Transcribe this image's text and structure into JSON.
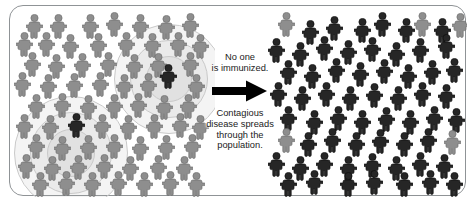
{
  "diagram": {
    "type": "two-panel-infographic",
    "colors": {
      "background": "#ffffff",
      "frame_border": "#8f9396",
      "healthy_person": "#8e8e8e",
      "healthy_person_outline": "#6f6f6f",
      "infected_person": "#262626",
      "infected_person_outline": "#0f0f0f",
      "halo_ring": "#c9c9c9",
      "arrow": "#000000",
      "caption_text": "#1b1b1b"
    },
    "center": {
      "caption_top": "No one\nis immunized.",
      "arrow_icon": "right-arrow-icon",
      "caption_bottom": "Contagious\ndisease spreads\nthrough the\npopulation."
    },
    "left_panel": {
      "name": "before-outbreak-panel",
      "legend": "Unvaccinated population with two initial infections",
      "halos": [
        {
          "cx": 158,
          "cy": 72,
          "r": 54
        },
        {
          "cx": 158,
          "cy": 72,
          "r": 38
        },
        {
          "cx": 158,
          "cy": 72,
          "r": 22
        },
        {
          "cx": 60,
          "cy": 146,
          "r": 56
        },
        {
          "cx": 60,
          "cy": 146,
          "r": 40
        },
        {
          "cx": 60,
          "cy": 146,
          "r": 23
        }
      ],
      "people": [
        {
          "x": 16,
          "y": 8,
          "state": "healthy"
        },
        {
          "x": 40,
          "y": 8,
          "state": "healthy"
        },
        {
          "x": 72,
          "y": 8,
          "state": "healthy"
        },
        {
          "x": 96,
          "y": 6,
          "state": "healthy"
        },
        {
          "x": 122,
          "y": 8,
          "state": "healthy"
        },
        {
          "x": 148,
          "y": 9,
          "state": "healthy"
        },
        {
          "x": 172,
          "y": 7,
          "state": "healthy"
        },
        {
          "x": 6,
          "y": 26,
          "state": "healthy"
        },
        {
          "x": 28,
          "y": 26,
          "state": "healthy"
        },
        {
          "x": 52,
          "y": 28,
          "state": "healthy"
        },
        {
          "x": 80,
          "y": 27,
          "state": "healthy"
        },
        {
          "x": 108,
          "y": 26,
          "state": "healthy"
        },
        {
          "x": 134,
          "y": 27,
          "state": "healthy"
        },
        {
          "x": 160,
          "y": 26,
          "state": "healthy"
        },
        {
          "x": 182,
          "y": 28,
          "state": "healthy"
        },
        {
          "x": 14,
          "y": 46,
          "state": "healthy"
        },
        {
          "x": 38,
          "y": 48,
          "state": "healthy"
        },
        {
          "x": 64,
          "y": 47,
          "state": "healthy"
        },
        {
          "x": 90,
          "y": 46,
          "state": "healthy"
        },
        {
          "x": 116,
          "y": 48,
          "state": "healthy"
        },
        {
          "x": 140,
          "y": 47,
          "state": "healthy"
        },
        {
          "x": 150,
          "y": 58,
          "state": "infected"
        },
        {
          "x": 172,
          "y": 46,
          "state": "healthy"
        },
        {
          "x": 4,
          "y": 66,
          "state": "healthy"
        },
        {
          "x": 30,
          "y": 68,
          "state": "healthy"
        },
        {
          "x": 56,
          "y": 67,
          "state": "healthy"
        },
        {
          "x": 82,
          "y": 66,
          "state": "healthy"
        },
        {
          "x": 106,
          "y": 68,
          "state": "healthy"
        },
        {
          "x": 130,
          "y": 67,
          "state": "healthy"
        },
        {
          "x": 178,
          "y": 68,
          "state": "healthy"
        },
        {
          "x": 18,
          "y": 88,
          "state": "healthy"
        },
        {
          "x": 44,
          "y": 87,
          "state": "healthy"
        },
        {
          "x": 70,
          "y": 89,
          "state": "healthy"
        },
        {
          "x": 96,
          "y": 88,
          "state": "healthy"
        },
        {
          "x": 120,
          "y": 87,
          "state": "healthy"
        },
        {
          "x": 146,
          "y": 89,
          "state": "healthy"
        },
        {
          "x": 170,
          "y": 88,
          "state": "healthy"
        },
        {
          "x": 6,
          "y": 108,
          "state": "healthy"
        },
        {
          "x": 32,
          "y": 109,
          "state": "healthy"
        },
        {
          "x": 58,
          "y": 107,
          "state": "infected"
        },
        {
          "x": 84,
          "y": 108,
          "state": "healthy"
        },
        {
          "x": 110,
          "y": 109,
          "state": "healthy"
        },
        {
          "x": 136,
          "y": 108,
          "state": "healthy"
        },
        {
          "x": 162,
          "y": 107,
          "state": "healthy"
        },
        {
          "x": 182,
          "y": 109,
          "state": "healthy"
        },
        {
          "x": 18,
          "y": 128,
          "state": "healthy"
        },
        {
          "x": 44,
          "y": 130,
          "state": "healthy"
        },
        {
          "x": 70,
          "y": 129,
          "state": "healthy"
        },
        {
          "x": 96,
          "y": 128,
          "state": "healthy"
        },
        {
          "x": 122,
          "y": 130,
          "state": "healthy"
        },
        {
          "x": 148,
          "y": 129,
          "state": "healthy"
        },
        {
          "x": 174,
          "y": 128,
          "state": "healthy"
        },
        {
          "x": 8,
          "y": 148,
          "state": "healthy"
        },
        {
          "x": 34,
          "y": 150,
          "state": "healthy"
        },
        {
          "x": 60,
          "y": 149,
          "state": "healthy"
        },
        {
          "x": 86,
          "y": 148,
          "state": "healthy"
        },
        {
          "x": 112,
          "y": 150,
          "state": "healthy"
        },
        {
          "x": 140,
          "y": 149,
          "state": "healthy"
        },
        {
          "x": 166,
          "y": 150,
          "state": "healthy"
        },
        {
          "x": 22,
          "y": 166,
          "state": "healthy"
        },
        {
          "x": 48,
          "y": 165,
          "state": "healthy"
        },
        {
          "x": 74,
          "y": 166,
          "state": "healthy"
        },
        {
          "x": 100,
          "y": 165,
          "state": "healthy"
        },
        {
          "x": 126,
          "y": 166,
          "state": "healthy"
        },
        {
          "x": 152,
          "y": 165,
          "state": "healthy"
        },
        {
          "x": 178,
          "y": 166,
          "state": "healthy"
        }
      ]
    },
    "right_panel": {
      "name": "after-outbreak-panel",
      "legend": "Nearly entire population infected after spread",
      "people": [
        {
          "x": 16,
          "y": 6,
          "state": "healthy"
        },
        {
          "x": 40,
          "y": 14,
          "state": "infected"
        },
        {
          "x": 64,
          "y": 10,
          "state": "infected"
        },
        {
          "x": 92,
          "y": 12,
          "state": "infected"
        },
        {
          "x": 112,
          "y": 6,
          "state": "infected"
        },
        {
          "x": 136,
          "y": 12,
          "state": "infected"
        },
        {
          "x": 152,
          "y": 6,
          "state": "healthy"
        },
        {
          "x": 172,
          "y": 12,
          "state": "infected"
        },
        {
          "x": 190,
          "y": 7,
          "state": "healthy"
        },
        {
          "x": 6,
          "y": 32,
          "state": "infected"
        },
        {
          "x": 30,
          "y": 36,
          "state": "infected"
        },
        {
          "x": 54,
          "y": 30,
          "state": "infected"
        },
        {
          "x": 78,
          "y": 34,
          "state": "infected"
        },
        {
          "x": 102,
          "y": 31,
          "state": "infected"
        },
        {
          "x": 126,
          "y": 36,
          "state": "infected"
        },
        {
          "x": 150,
          "y": 32,
          "state": "infected"
        },
        {
          "x": 176,
          "y": 28,
          "state": "infected"
        },
        {
          "x": 18,
          "y": 54,
          "state": "infected"
        },
        {
          "x": 42,
          "y": 58,
          "state": "infected"
        },
        {
          "x": 66,
          "y": 52,
          "state": "infected"
        },
        {
          "x": 90,
          "y": 56,
          "state": "infected"
        },
        {
          "x": 114,
          "y": 53,
          "state": "infected"
        },
        {
          "x": 138,
          "y": 58,
          "state": "infected"
        },
        {
          "x": 162,
          "y": 54,
          "state": "infected"
        },
        {
          "x": 184,
          "y": 52,
          "state": "infected"
        },
        {
          "x": 8,
          "y": 76,
          "state": "infected"
        },
        {
          "x": 32,
          "y": 80,
          "state": "infected"
        },
        {
          "x": 56,
          "y": 76,
          "state": "infected"
        },
        {
          "x": 80,
          "y": 80,
          "state": "infected"
        },
        {
          "x": 104,
          "y": 77,
          "state": "infected"
        },
        {
          "x": 128,
          "y": 80,
          "state": "infected"
        },
        {
          "x": 152,
          "y": 76,
          "state": "infected"
        },
        {
          "x": 176,
          "y": 78,
          "state": "infected"
        },
        {
          "x": 18,
          "y": 100,
          "state": "infected"
        },
        {
          "x": 44,
          "y": 104,
          "state": "infected"
        },
        {
          "x": 68,
          "y": 100,
          "state": "infected"
        },
        {
          "x": 92,
          "y": 104,
          "state": "infected"
        },
        {
          "x": 116,
          "y": 101,
          "state": "infected"
        },
        {
          "x": 140,
          "y": 104,
          "state": "infected"
        },
        {
          "x": 164,
          "y": 100,
          "state": "infected"
        },
        {
          "x": 186,
          "y": 102,
          "state": "infected"
        },
        {
          "x": 16,
          "y": 122,
          "state": "healthy"
        },
        {
          "x": 38,
          "y": 126,
          "state": "infected"
        },
        {
          "x": 62,
          "y": 122,
          "state": "infected"
        },
        {
          "x": 86,
          "y": 126,
          "state": "infected"
        },
        {
          "x": 110,
          "y": 123,
          "state": "infected"
        },
        {
          "x": 134,
          "y": 126,
          "state": "infected"
        },
        {
          "x": 158,
          "y": 122,
          "state": "infected"
        },
        {
          "x": 182,
          "y": 124,
          "state": "healthy"
        },
        {
          "x": 6,
          "y": 146,
          "state": "infected"
        },
        {
          "x": 30,
          "y": 150,
          "state": "infected"
        },
        {
          "x": 54,
          "y": 146,
          "state": "infected"
        },
        {
          "x": 78,
          "y": 150,
          "state": "infected"
        },
        {
          "x": 102,
          "y": 147,
          "state": "infected"
        },
        {
          "x": 126,
          "y": 150,
          "state": "infected"
        },
        {
          "x": 150,
          "y": 146,
          "state": "infected"
        },
        {
          "x": 174,
          "y": 148,
          "state": "infected"
        },
        {
          "x": 18,
          "y": 166,
          "state": "infected"
        },
        {
          "x": 44,
          "y": 164,
          "state": "infected"
        },
        {
          "x": 78,
          "y": 166,
          "state": "infected"
        },
        {
          "x": 104,
          "y": 164,
          "state": "infected"
        },
        {
          "x": 134,
          "y": 166,
          "state": "infected"
        },
        {
          "x": 160,
          "y": 164,
          "state": "infected"
        },
        {
          "x": 184,
          "y": 166,
          "state": "infected"
        }
      ]
    }
  }
}
